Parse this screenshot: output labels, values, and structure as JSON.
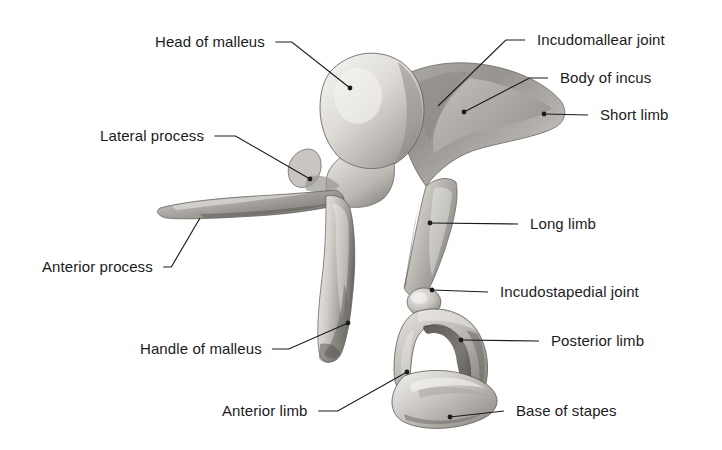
{
  "figure": {
    "background_color": "#ffffff",
    "text_color": "#1b1b1b",
    "leader_color": "#1b1b1b",
    "bone_light": "#e6e4e1",
    "bone_mid": "#b9b6b2",
    "bone_dark": "#6e6b68",
    "bone_shadow": "#46433f"
  },
  "labels": [
    {
      "id": "head-of-malleus",
      "text": "Head of malleus",
      "side": "left",
      "x": 155,
      "y": 34,
      "tip_x": 350,
      "tip_y": 88,
      "dot": true
    },
    {
      "id": "incudomallear-joint",
      "text": "Incudomallear joint",
      "side": "right",
      "x": 537,
      "y": 32,
      "tip_x": 438,
      "tip_y": 106,
      "dot": false
    },
    {
      "id": "body-of-incus",
      "text": "Body of incus",
      "side": "right",
      "x": 560,
      "y": 70,
      "tip_x": 464,
      "tip_y": 112,
      "dot": true
    },
    {
      "id": "short-limb",
      "text": "Short limb",
      "side": "right",
      "x": 600,
      "y": 107,
      "tip_x": 544,
      "tip_y": 114,
      "dot": true
    },
    {
      "id": "lateral-process",
      "text": "Lateral process",
      "side": "left",
      "x": 100,
      "y": 128,
      "tip_x": 310,
      "tip_y": 179,
      "dot": true
    },
    {
      "id": "long-limb",
      "text": "Long limb",
      "side": "right",
      "x": 530,
      "y": 216,
      "tip_x": 430,
      "tip_y": 223,
      "dot": true
    },
    {
      "id": "anterior-process",
      "text": "Anterior process",
      "side": "left",
      "x": 42,
      "y": 259,
      "tip_x": 200,
      "tip_y": 218,
      "dot": false
    },
    {
      "id": "incudostapedial-joint",
      "text": "Incudostapedial joint",
      "side": "right",
      "x": 500,
      "y": 284,
      "tip_x": 432,
      "tip_y": 290,
      "dot": true
    },
    {
      "id": "handle-of-malleus",
      "text": "Handle of malleus",
      "side": "left",
      "x": 140,
      "y": 341,
      "tip_x": 348,
      "tip_y": 323,
      "dot": true
    },
    {
      "id": "posterior-limb",
      "text": "Posterior limb",
      "side": "right",
      "x": 551,
      "y": 333,
      "tip_x": 461,
      "tip_y": 340,
      "dot": true
    },
    {
      "id": "anterior-limb",
      "text": "Anterior limb",
      "side": "left",
      "x": 222,
      "y": 403,
      "tip_x": 407,
      "tip_y": 372,
      "dot": true
    },
    {
      "id": "base-of-stapes",
      "text": "Base of stapes",
      "side": "right",
      "x": 516,
      "y": 403,
      "tip_x": 450,
      "tip_y": 417,
      "dot": true
    }
  ]
}
